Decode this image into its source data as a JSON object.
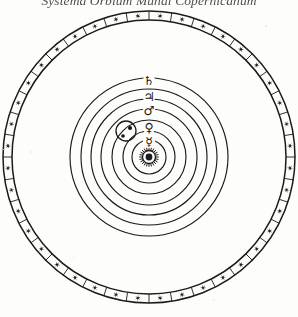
{
  "plate": {
    "title": "Systema Orbium Mundi Copernicanum",
    "background_color": "#fdfdfb",
    "ink_color": "#1a1a1a",
    "width": 298,
    "height": 317
  },
  "diagram": {
    "type": "heliocentric-orrery",
    "center": {
      "x": 149,
      "y": 157
    },
    "star_band": {
      "label": "Sphere of the Fixed Stars",
      "outer_radius": 146,
      "inner_radius": 137,
      "star_count": 40,
      "star_glyph": "star-6-point"
    },
    "sun": {
      "label": "Sol",
      "symbol": "☉",
      "radius": 6.5,
      "ray_count": 24
    },
    "orbits": [
      {
        "name": "Mercurii",
        "radius": 17
      },
      {
        "name": "Veneris",
        "radius": 26
      },
      {
        "name": "Telluris",
        "radius": 37
      },
      {
        "name": "Martis",
        "radius": 48
      },
      {
        "name": "Iovis",
        "radius": 58
      },
      {
        "name": "Saturni",
        "radius": 68
      },
      {
        "name": "Firmament",
        "radius": 79
      }
    ],
    "planets": [
      {
        "name": "Saturnus",
        "symbol": "♄",
        "orbit_radius": 79,
        "x": 149,
        "y": 81
      },
      {
        "name": "Iupiter",
        "symbol": "♃",
        "orbit_radius": 68,
        "x": 149,
        "y": 97
      },
      {
        "name": "Mars",
        "symbol": "♂",
        "orbit_radius": 58,
        "x": 149,
        "y": 111
      },
      {
        "name": "Venus",
        "symbol": "♀",
        "orbit_radius": 37,
        "x": 149,
        "y": 128
      },
      {
        "name": "Mercurius",
        "symbol": "☿",
        "orbit_radius": 26,
        "x": 149,
        "y": 142
      }
    ],
    "earth_moon": {
      "name": "Terra cum Luna",
      "epicycle_center": {
        "x": 126,
        "y": 131
      },
      "epicycle_radius": 10,
      "earth": {
        "x": 130,
        "y": 128
      },
      "moon": {
        "x": 123,
        "y": 136
      }
    }
  }
}
